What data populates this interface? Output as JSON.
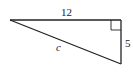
{
  "diagram": {
    "type": "right-triangle",
    "stroke_color": "#222222",
    "background": "#ffffff",
    "vertices": {
      "left": [
        10,
        20
      ],
      "right_angle": [
        121,
        20
      ],
      "bottom": [
        121,
        64
      ]
    },
    "labels": {
      "top_side": "12",
      "right_side": "5",
      "hypotenuse": "c"
    },
    "right_angle_marker": true
  }
}
